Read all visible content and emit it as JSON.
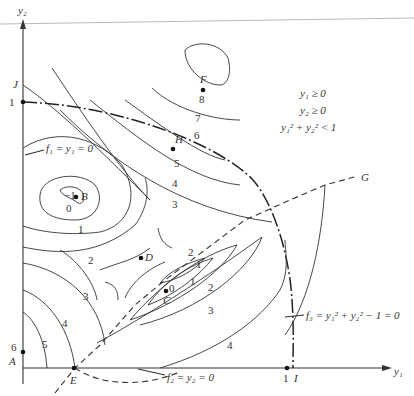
{
  "figure": {
    "axes": {
      "x_label": "y₁",
      "y_label": "y₂",
      "x_tick": "1",
      "y_tick": "1"
    },
    "points": [
      {
        "id": "A",
        "label": "A"
      },
      {
        "id": "B",
        "label": "B"
      },
      {
        "id": "C",
        "label": "C"
      },
      {
        "id": "D",
        "label": "D"
      },
      {
        "id": "E",
        "label": "E"
      },
      {
        "id": "F",
        "label": "F"
      },
      {
        "id": "G",
        "label": "G"
      },
      {
        "id": "H",
        "label": "H"
      },
      {
        "id": "I",
        "label": "I"
      },
      {
        "id": "J",
        "label": "J"
      }
    ],
    "constraints_box": [
      "y₁ ≥ 0",
      "y₂ ≥ 0",
      "y₁² + y₂² < 1"
    ],
    "constraint_labels": {
      "f1": "f₁ = y₁ = 0",
      "f2": "f₂ = y₂ = 0",
      "f3": "f₃ = y₁² + y₂² − 1 = 0"
    },
    "contour_labels": {
      "B_minus1": "−1",
      "B_0": "0",
      "B_1": "1",
      "left_2": "2",
      "left_3": "3",
      "left_4": "4",
      "left_5": "5",
      "A_6": "6",
      "C_0": "0",
      "C_1a": "1",
      "C_1b": "1",
      "C_2a": "2",
      "C_2b": "2",
      "C_3": "3",
      "right_4": "4",
      "H_3": "3",
      "H_4": "4",
      "H_5": "5",
      "F_6": "6",
      "F_7": "7",
      "F_8": "8"
    }
  }
}
